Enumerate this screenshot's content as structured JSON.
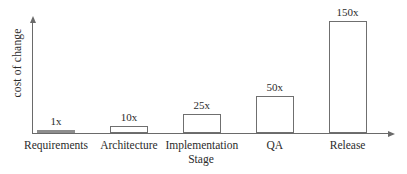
{
  "figure": {
    "background": "#ffffff",
    "axis_color": "#6a6a6a",
    "text_color": "#2b2b2b"
  },
  "chart_data": {
    "type": "bar",
    "title": "",
    "xlabel": "Stage",
    "ylabel": "cost of change",
    "categories": [
      "Requirements",
      "Architecture",
      "Implementation",
      "QA",
      "Release"
    ],
    "values": [
      1,
      10,
      25,
      50,
      150
    ],
    "bar_labels": [
      "1x",
      "10x",
      "25x",
      "50x",
      "150x"
    ],
    "ylim": [
      0,
      155
    ],
    "grid": false,
    "legend": "none",
    "y_ticks": [],
    "bar_fill": "#ffffff",
    "bar_border": "#6f6f6f",
    "flat_bar_fill": "#8d8d8d"
  }
}
